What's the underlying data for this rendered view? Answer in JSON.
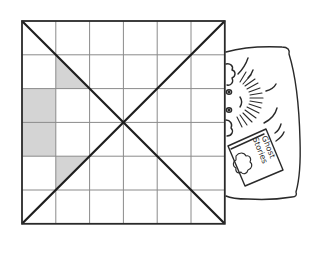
{
  "figure": {
    "type": "grid-puzzle-illustration",
    "grid": {
      "rows": 6,
      "cols": 6,
      "origin": [
        22,
        21
      ],
      "cell_size": 33.8,
      "line_color": "#8a8a8a",
      "border_color": "#2a2a2a",
      "diagonal_color": "#1e1e1e",
      "shade_color": "#d4d4d4",
      "diagonals": [
        "top-left-to-bottom-right",
        "top-right-to-bottom-left"
      ],
      "shaded_cells": [
        {
          "col": 0,
          "row": 2,
          "shape": "full"
        },
        {
          "col": 0,
          "row": 3,
          "shape": "full"
        },
        {
          "col": 1,
          "row": 1,
          "shape": "triangle-lower-left"
        },
        {
          "col": 1,
          "row": 4,
          "shape": "triangle-upper-left"
        }
      ]
    },
    "illustration": {
      "description": "character peeking from behind the grid, lying on a pillow holding a book",
      "book_title_line1": "Ghost",
      "book_title_line2": "Stories",
      "stroke_color": "#2a2a2a"
    }
  }
}
